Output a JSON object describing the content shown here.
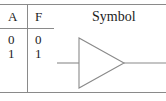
{
  "diagram": {
    "kind": "logic-gate-truth-table",
    "gate_name": "buffer",
    "line_color": "#8a8a8a",
    "text_color": "#1d1d1d",
    "background": "#ffffff"
  },
  "truth_table": {
    "headers": [
      "A",
      "F"
    ],
    "rows": [
      {
        "A": "0",
        "F": "0"
      },
      {
        "A": "1",
        "F": "1"
      }
    ]
  },
  "symbol": {
    "heading": "Symbol",
    "shape": "triangle-buffer",
    "input_label": "",
    "output_label": "",
    "geometry": {
      "triangle_top_left_x": 79,
      "triangle_top_y": 38,
      "triangle_bottom_y": 88,
      "triangle_apex_x": 124,
      "triangle_apex_y": 63,
      "input_line_start_x": 57,
      "output_line_end_x": 166
    }
  }
}
